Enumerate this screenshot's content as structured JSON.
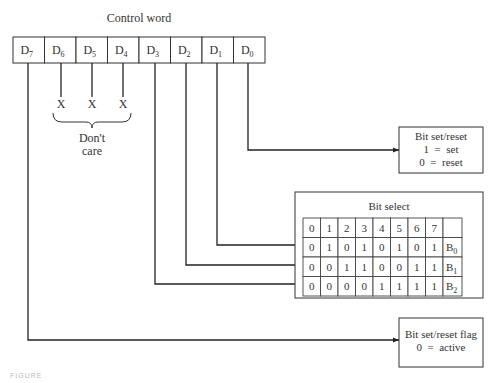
{
  "title": "Control word",
  "bits": [
    {
      "name": "D",
      "sub": "7"
    },
    {
      "name": "D",
      "sub": "6"
    },
    {
      "name": "D",
      "sub": "5"
    },
    {
      "name": "D",
      "sub": "4"
    },
    {
      "name": "D",
      "sub": "3"
    },
    {
      "name": "D",
      "sub": "2"
    },
    {
      "name": "D",
      "sub": "1"
    },
    {
      "name": "D",
      "sub": "0"
    }
  ],
  "dont_care": {
    "marks": [
      "X",
      "X",
      "X"
    ],
    "label_line1": "Don't",
    "label_line2": "care"
  },
  "bit_set_reset": {
    "title": "Bit set/reset",
    "line1": "1  =  set",
    "line2": "0  =  reset"
  },
  "bit_select": {
    "title": "Bit select",
    "header": [
      "0",
      "1",
      "2",
      "3",
      "4",
      "5",
      "6",
      "7",
      ""
    ],
    "rows": [
      {
        "values": [
          "0",
          "1",
          "0",
          "1",
          "0",
          "1",
          "0",
          "1"
        ],
        "label": "B",
        "sub": "0"
      },
      {
        "values": [
          "0",
          "0",
          "1",
          "1",
          "0",
          "0",
          "1",
          "1"
        ],
        "label": "B",
        "sub": "1"
      },
      {
        "values": [
          "0",
          "0",
          "0",
          "0",
          "1",
          "1",
          "1",
          "1"
        ],
        "label": "B",
        "sub": "2"
      }
    ]
  },
  "flag": {
    "title": "Bit set/reset flag",
    "line1": "0  =  active"
  },
  "caption": "FIGURE"
}
